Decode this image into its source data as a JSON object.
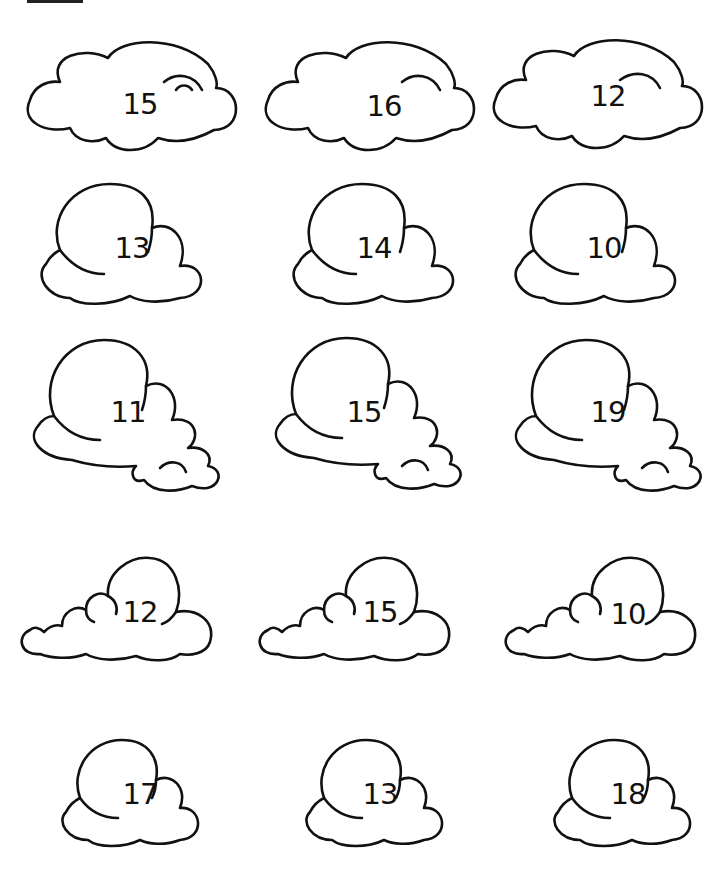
{
  "worksheet": {
    "rows": [
      {
        "shape": "wide",
        "numbers": [
          "15",
          "16",
          "12"
        ]
      },
      {
        "shape": "puff",
        "numbers": [
          "13",
          "14",
          "10"
        ]
      },
      {
        "shape": "puff-tail",
        "numbers": [
          "11",
          "15",
          "19"
        ]
      },
      {
        "shape": "long-low",
        "numbers": [
          "12",
          "15",
          "10"
        ]
      },
      {
        "shape": "small-puff",
        "numbers": [
          "17",
          "13",
          "18"
        ]
      }
    ]
  }
}
